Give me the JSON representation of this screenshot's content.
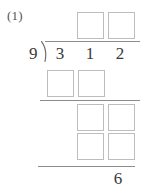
{
  "worksheet": {
    "problem_label": "(1)",
    "type": "long-division",
    "divisor": "9",
    "dividend_digits": [
      "3",
      "1",
      "2"
    ],
    "remainder_digit": "6",
    "box_placeholder": "",
    "colors": {
      "box_border": "#bdbdbd",
      "rule": "#8c8c8c",
      "text": "#3a3a3a",
      "label_text": "#555555",
      "background": "#ffffff"
    },
    "quotient_boxes": [
      {
        "name": "quotient-digit-1",
        "value": ""
      },
      {
        "name": "quotient-digit-2",
        "value": ""
      }
    ],
    "work_rows": [
      {
        "name": "first-partial-product",
        "boxes": [
          {
            "name": "partial-product-1-tens",
            "value": ""
          },
          {
            "name": "partial-product-1-ones",
            "value": ""
          }
        ]
      },
      {
        "name": "first-remainder-bringdown",
        "boxes": [
          {
            "name": "bringdown-tens",
            "value": ""
          },
          {
            "name": "bringdown-ones",
            "value": ""
          }
        ]
      },
      {
        "name": "second-partial-product",
        "boxes": [
          {
            "name": "partial-product-2-tens",
            "value": ""
          },
          {
            "name": "partial-product-2-ones",
            "value": ""
          }
        ]
      }
    ]
  }
}
